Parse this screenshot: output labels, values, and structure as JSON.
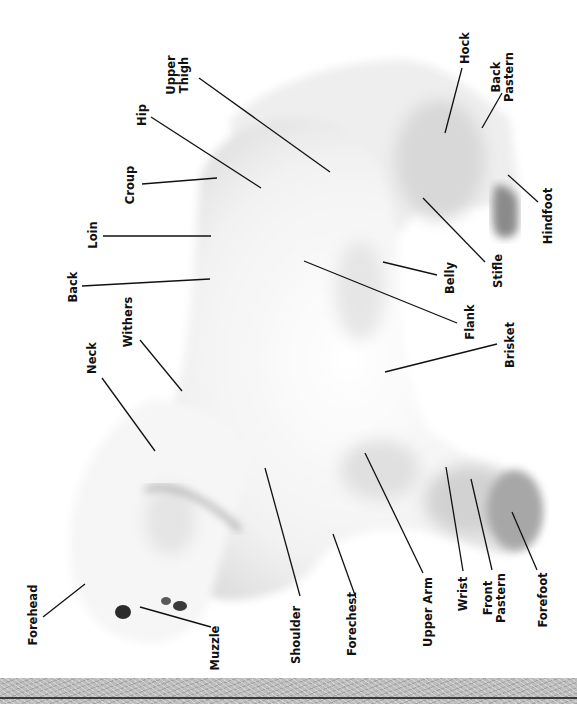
{
  "diagram": {
    "orientation": "rotated -90deg, head at bottom-left, tail at top",
    "colors": {
      "background": "#ffffff",
      "coat_light": "#f4f4f4",
      "coat_shadow": "#cfcfcf",
      "paw_pad": "#6e6e6e",
      "label_text": "#111111",
      "leader_line": "#111111",
      "bottom_band": "#bcbcbc",
      "bottom_rule": "#3a3a3a"
    },
    "labels": [
      {
        "id": "upper-thigh",
        "text": "Upper\nThigh",
        "x": 177,
        "y": 75,
        "line": [
          199,
          78,
          330,
          172
        ]
      },
      {
        "id": "hip",
        "text": "Hip",
        "x": 142,
        "y": 115,
        "line": [
          151,
          117,
          261,
          188
        ]
      },
      {
        "id": "croup",
        "text": "Croup",
        "x": 130,
        "y": 185,
        "line": [
          142,
          184,
          217,
          178
        ]
      },
      {
        "id": "loin",
        "text": "Loin",
        "x": 93,
        "y": 235,
        "line": [
          103,
          236,
          211,
          236
        ]
      },
      {
        "id": "back",
        "text": "Back",
        "x": 73,
        "y": 287,
        "line": [
          82,
          286,
          210,
          279
        ]
      },
      {
        "id": "withers",
        "text": "Withers",
        "x": 128,
        "y": 322,
        "line": [
          140,
          340,
          182,
          391
        ]
      },
      {
        "id": "neck",
        "text": "Neck",
        "x": 92,
        "y": 358,
        "line": [
          102,
          378,
          155,
          451
        ]
      },
      {
        "id": "forehead",
        "text": "Forehead",
        "x": 33,
        "y": 615,
        "line": [
          43,
          617,
          85,
          584
        ]
      },
      {
        "id": "muzzle",
        "text": "Muzzle",
        "x": 215,
        "y": 648,
        "line": [
          211,
          627,
          140,
          607
        ]
      },
      {
        "id": "hock",
        "text": "Hock",
        "x": 465,
        "y": 48,
        "line": [
          462,
          68,
          445,
          133
        ]
      },
      {
        "id": "back-pastern",
        "text": "Back\nPastern",
        "x": 502,
        "y": 77,
        "line": [
          502,
          93,
          482,
          128
        ]
      },
      {
        "id": "hindfoot",
        "text": "Hindfoot",
        "x": 548,
        "y": 216,
        "line": [
          538,
          202,
          508,
          175
        ]
      },
      {
        "id": "stifle",
        "text": "Stifle",
        "x": 498,
        "y": 271,
        "line": [
          485,
          262,
          423,
          198
        ]
      },
      {
        "id": "belly",
        "text": "Belly",
        "x": 450,
        "y": 278,
        "line": [
          437,
          275,
          383,
          262
        ]
      },
      {
        "id": "flank",
        "text": "Flank",
        "x": 470,
        "y": 322,
        "line": [
          457,
          323,
          304,
          261
        ]
      },
      {
        "id": "brisket",
        "text": "Brisket",
        "x": 510,
        "y": 345,
        "line": [
          497,
          344,
          385,
          372
        ]
      },
      {
        "id": "shoulder",
        "text": "Shoulder",
        "x": 296,
        "y": 635,
        "line": [
          300,
          596,
          265,
          468
        ]
      },
      {
        "id": "forechest",
        "text": "Forechest",
        "x": 352,
        "y": 624,
        "line": [
          356,
          598,
          333,
          534
        ]
      },
      {
        "id": "upper-arm",
        "text": "Upper Arm",
        "x": 428,
        "y": 612,
        "line": [
          423,
          573,
          365,
          453
        ]
      },
      {
        "id": "wrist",
        "text": "Wrist",
        "x": 463,
        "y": 594,
        "line": [
          463,
          571,
          446,
          467
        ]
      },
      {
        "id": "front-pastern",
        "text": "Front\nPastern",
        "x": 494,
        "y": 598,
        "line": [
          492,
          570,
          471,
          479
        ]
      },
      {
        "id": "forefoot",
        "text": "Forefoot",
        "x": 543,
        "y": 600,
        "line": [
          537,
          570,
          512,
          512
        ]
      }
    ]
  }
}
